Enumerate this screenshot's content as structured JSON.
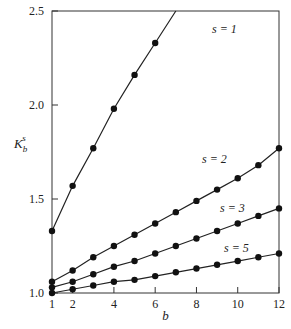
{
  "chart_data": {
    "type": "line",
    "title": "",
    "xlabel": "b",
    "ylabel": "K_b^s",
    "xlim": [
      1,
      12
    ],
    "ylim": [
      1.0,
      2.5
    ],
    "x_ticks": [
      1,
      2,
      4,
      6,
      8,
      10,
      12
    ],
    "y_ticks": [
      1.0,
      1.5,
      2.0,
      2.5
    ],
    "grid": false,
    "legend": "inline labels",
    "series": [
      {
        "name": "s = 1",
        "x": [
          1,
          2,
          3,
          4,
          5,
          6
        ],
        "values": [
          1.33,
          1.57,
          1.77,
          1.98,
          2.16,
          2.33
        ],
        "line_extends_to": [
          7,
          2.5
        ]
      },
      {
        "name": "s = 2",
        "x": [
          1,
          2,
          3,
          4,
          5,
          6,
          7,
          8,
          9,
          10,
          11,
          12
        ],
        "values": [
          1.06,
          1.12,
          1.19,
          1.25,
          1.31,
          1.37,
          1.43,
          1.49,
          1.55,
          1.61,
          1.68,
          1.77
        ]
      },
      {
        "name": "s = 3",
        "x": [
          1,
          2,
          3,
          4,
          5,
          6,
          7,
          8,
          9,
          10,
          11,
          12
        ],
        "values": [
          1.03,
          1.06,
          1.1,
          1.14,
          1.17,
          1.21,
          1.25,
          1.29,
          1.33,
          1.37,
          1.41,
          1.45
        ]
      },
      {
        "name": "s = 5",
        "x": [
          1,
          2,
          3,
          4,
          5,
          6,
          7,
          8,
          9,
          10,
          11,
          12
        ],
        "values": [
          1.0,
          1.02,
          1.04,
          1.06,
          1.07,
          1.09,
          1.11,
          1.13,
          1.15,
          1.17,
          1.19,
          1.21
        ]
      }
    ]
  },
  "labels": {
    "ylabel_main": "K",
    "ylabel_sub": "b",
    "ylabel_sup": "s",
    "xlabel": "b",
    "s1": "s = 1",
    "s2": "s = 2",
    "s3": "s = 3",
    "s5": "s = 5",
    "y_ticks": [
      "1.0",
      "1.5",
      "2.0",
      "2.5"
    ],
    "x_ticks": [
      "1",
      "2",
      "4",
      "6",
      "8",
      "10",
      "12"
    ]
  }
}
